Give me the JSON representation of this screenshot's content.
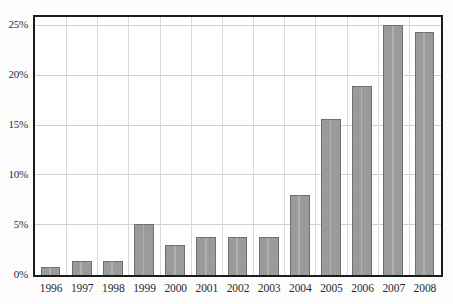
{
  "chart_data": {
    "type": "bar",
    "title": "",
    "subtitle": "",
    "xlabel": "",
    "ylabel": "",
    "categories": [
      "1996",
      "1997",
      "1998",
      "1999",
      "2000",
      "2001",
      "2002",
      "2003",
      "2004",
      "2005",
      "2006",
      "2007",
      "2008"
    ],
    "values": [
      0.8,
      1.4,
      1.4,
      5.1,
      3.0,
      3.8,
      3.8,
      3.8,
      8.0,
      15.7,
      19.0,
      25.1,
      24.4
    ],
    "value_unit": "%",
    "ylim": [
      0,
      25.8
    ],
    "yticks": [
      0,
      5,
      10,
      15,
      20,
      25
    ],
    "ytick_labels": [
      "0%",
      "5%",
      "10%",
      "15%",
      "20%",
      "25%"
    ],
    "grid": "both",
    "legend": "none",
    "series": [
      {
        "name": "",
        "values": [
          0.8,
          1.4,
          1.4,
          5.1,
          3.0,
          3.8,
          3.8,
          3.8,
          8.0,
          15.7,
          19.0,
          25.1,
          24.4
        ]
      }
    ]
  },
  "style": {
    "bar_fill": "#9b9b9b",
    "bar_stroke": "#6f6f6f",
    "frame_color": "#1c1c1c",
    "hgrid_color": "#d2d2d2",
    "vgrid_color": "#d9d9d9",
    "text_color": "#2b2b2b",
    "plot_background": "#ffffff",
    "page_background": "#fdfdfd"
  }
}
